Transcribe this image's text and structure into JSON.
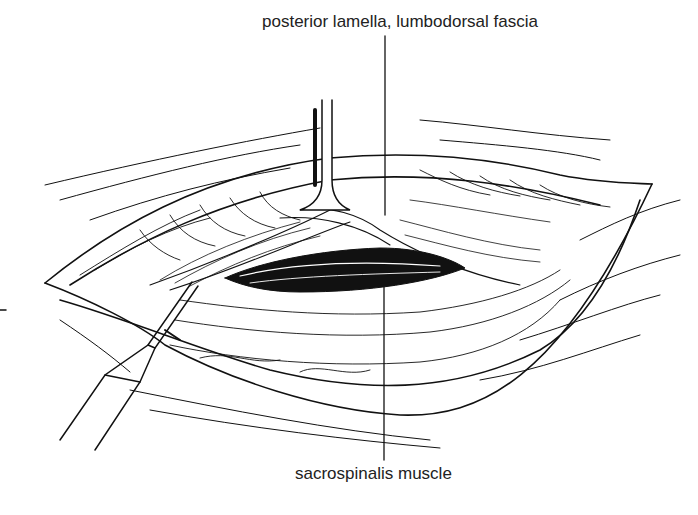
{
  "figure": {
    "labels": {
      "top": "posterior lamella, lumbodorsal fascia",
      "bottom": "sacrospinalis muscle"
    },
    "colors": {
      "ink": "#111111",
      "background": "#ffffff"
    }
  }
}
